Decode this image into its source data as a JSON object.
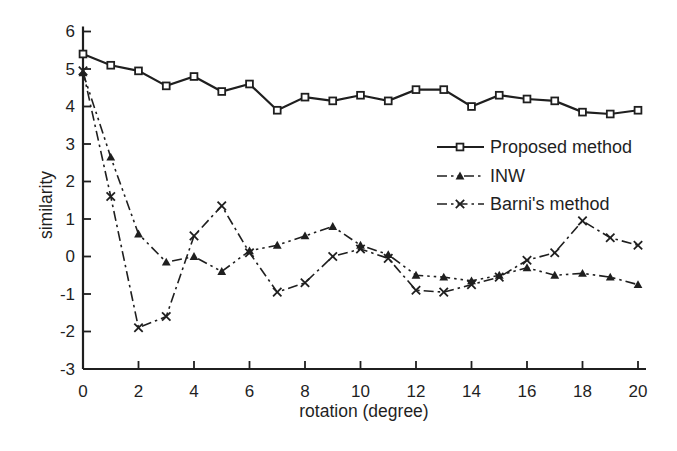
{
  "page": {
    "background_color": "#ffffff",
    "ink_color": "#1f1f1f"
  },
  "chart_data": {
    "type": "line",
    "title": "",
    "xlabel": "rotation (degree)",
    "ylabel": "similarity",
    "xlim": [
      0,
      20
    ],
    "ylim": [
      -3,
      6
    ],
    "xticks": [
      0,
      2,
      4,
      6,
      8,
      10,
      12,
      14,
      16,
      18,
      20
    ],
    "yticks": [
      -3,
      -2,
      -1,
      0,
      1,
      2,
      3,
      4,
      5,
      6
    ],
    "grid": false,
    "legend_position": "center-right",
    "x": [
      0,
      1,
      2,
      3,
      4,
      5,
      6,
      7,
      8,
      9,
      10,
      11,
      12,
      13,
      14,
      15,
      16,
      17,
      18,
      19,
      20
    ],
    "series": [
      {
        "name": "Proposed method",
        "line": "solid",
        "marker": "open-square",
        "values": [
          5.4,
          5.1,
          4.95,
          4.55,
          4.8,
          4.4,
          4.6,
          3.9,
          4.25,
          4.15,
          4.3,
          4.15,
          4.45,
          4.45,
          4.0,
          4.3,
          4.2,
          4.15,
          3.85,
          3.8,
          3.9
        ]
      },
      {
        "name": "INW",
        "line": "dash-dot-dot",
        "marker": "filled-triangle",
        "values": [
          4.9,
          2.65,
          0.6,
          -0.15,
          0.0,
          -0.4,
          0.15,
          0.3,
          0.55,
          0.8,
          0.3,
          0.05,
          -0.5,
          -0.55,
          -0.65,
          -0.5,
          -0.3,
          -0.5,
          -0.45,
          -0.55,
          -0.75
        ]
      },
      {
        "name": "Barni's method",
        "line": "dash-dot",
        "marker": "x-cross",
        "values": [
          4.95,
          1.6,
          -1.9,
          -1.6,
          0.55,
          1.35,
          0.1,
          -0.95,
          -0.7,
          0.0,
          0.2,
          -0.05,
          -0.9,
          -0.95,
          -0.75,
          -0.55,
          -0.1,
          0.1,
          0.95,
          0.5,
          0.3
        ]
      }
    ],
    "color": "#1f1f1f"
  }
}
